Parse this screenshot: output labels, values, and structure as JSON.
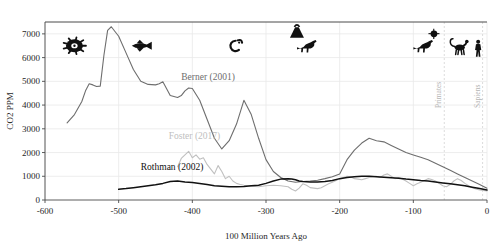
{
  "chart_data": {
    "type": "line",
    "title": "",
    "xlabel": "100 Million Years Ago",
    "ylabel": "CO2 PPM",
    "xlim": [
      -600,
      0
    ],
    "ylim": [
      0,
      7500
    ],
    "grid": true,
    "legend_position": "inline-annotations",
    "xticks": [
      -600,
      -500,
      -400,
      -300,
      -200,
      -100,
      0
    ],
    "xtick_labels": [
      "-600",
      "-500",
      "-400",
      "-300",
      "-200",
      "-100",
      "0"
    ],
    "yticks": [
      0,
      1000,
      2000,
      3000,
      4000,
      5000,
      6000,
      7000
    ],
    "ytick_labels": [
      "0",
      "1000",
      "2000",
      "3000",
      "4000",
      "5000",
      "6000",
      "7000"
    ],
    "series": [
      {
        "name": "Berner (2001)",
        "color": "#6e6e6e",
        "label_x": -415,
        "label_y": 5050,
        "x": [
          -570,
          -560,
          -550,
          -545,
          -540,
          -535,
          -530,
          -525,
          -520,
          -515,
          -510,
          -500,
          -490,
          -480,
          -470,
          -460,
          -450,
          -445,
          -440,
          -430,
          -420,
          -415,
          -410,
          -405,
          -400,
          -390,
          -380,
          -370,
          -360,
          -350,
          -340,
          -330,
          -320,
          -310,
          -300,
          -290,
          -280,
          -270,
          -260,
          -250,
          -240,
          -230,
          -220,
          -210,
          -200,
          -190,
          -180,
          -170,
          -160,
          -150,
          -140,
          -130,
          -120,
          -110,
          -100,
          -90,
          -80,
          -70,
          -60,
          -50,
          -40,
          -30,
          -20,
          -10,
          0
        ],
        "y": [
          3250,
          3600,
          4150,
          4600,
          4900,
          4850,
          4780,
          4800,
          6100,
          7150,
          7300,
          6900,
          6200,
          5500,
          5000,
          4870,
          4850,
          4900,
          4980,
          4400,
          4320,
          4400,
          4600,
          4720,
          4700,
          4200,
          3400,
          2600,
          2150,
          2500,
          3200,
          4200,
          3600,
          2600,
          1700,
          1200,
          950,
          800,
          750,
          780,
          800,
          830,
          900,
          980,
          1100,
          1700,
          2100,
          2400,
          2600,
          2500,
          2450,
          2300,
          2150,
          2000,
          1900,
          1800,
          1700,
          1550,
          1400,
          1250,
          1100,
          950,
          800,
          650,
          500
        ]
      },
      {
        "name": "Foster (2017)",
        "color": "#c0c0c0",
        "label_x": -432,
        "label_y": 2560,
        "x": [
          -420,
          -415,
          -410,
          -405,
          -400,
          -395,
          -390,
          -385,
          -380,
          -375,
          -370,
          -365,
          -360,
          -355,
          -350,
          -345,
          -340,
          -335,
          -330,
          -325,
          -320,
          -310,
          -300,
          -290,
          -280,
          -270,
          -265,
          -260,
          -255,
          -250,
          -245,
          -240,
          -235,
          -230,
          -225,
          -220,
          -215,
          -210,
          -205,
          -200,
          -195,
          -190,
          -185,
          -180,
          -175,
          -170,
          -165,
          -160,
          -155,
          -150,
          -145,
          -140,
          -135,
          -130,
          -125,
          -120,
          -115,
          -110,
          -105,
          -100,
          -95,
          -90,
          -85,
          -80,
          -75,
          -70,
          -65,
          -60,
          -55,
          -50,
          -45,
          -40,
          -35,
          -30,
          -25,
          -20,
          -15,
          -10,
          -5,
          0
        ],
        "y": [
          1400,
          1750,
          1900,
          2050,
          1780,
          1900,
          1720,
          1780,
          1500,
          1300,
          1100,
          1450,
          1200,
          900,
          1000,
          800,
          700,
          650,
          620,
          600,
          580,
          560,
          600,
          620,
          600,
          560,
          450,
          380,
          500,
          680,
          620,
          520,
          500,
          480,
          520,
          600,
          680,
          750,
          820,
          900,
          950,
          1000,
          980,
          900,
          880,
          850,
          900,
          950,
          980,
          1000,
          950,
          1050,
          1100,
          1000,
          900,
          950,
          880,
          800,
          700,
          600,
          680,
          750,
          820,
          900,
          860,
          800,
          700,
          600,
          560,
          650,
          800,
          900,
          820,
          700,
          600,
          520,
          460,
          420,
          400,
          380
        ]
      },
      {
        "name": "Rothman (2002)",
        "color": "#111111",
        "label_x": -470,
        "label_y": 1280,
        "x": [
          -500,
          -490,
          -480,
          -470,
          -460,
          -450,
          -440,
          -430,
          -420,
          -410,
          -400,
          -390,
          -380,
          -370,
          -360,
          -350,
          -340,
          -330,
          -320,
          -310,
          -300,
          -290,
          -280,
          -270,
          -265,
          -260,
          -255,
          -250,
          -240,
          -230,
          -220,
          -210,
          -200,
          -190,
          -180,
          -170,
          -160,
          -150,
          -140,
          -130,
          -120,
          -110,
          -100,
          -90,
          -80,
          -70,
          -60,
          -50,
          -40,
          -30,
          -20,
          -10,
          0
        ],
        "y": [
          450,
          480,
          520,
          560,
          600,
          640,
          700,
          780,
          800,
          760,
          740,
          700,
          650,
          600,
          580,
          560,
          560,
          570,
          600,
          620,
          700,
          800,
          880,
          900,
          880,
          850,
          800,
          780,
          760,
          760,
          780,
          820,
          900,
          950,
          980,
          1000,
          1000,
          980,
          960,
          940,
          920,
          880,
          850,
          820,
          800,
          760,
          720,
          680,
          640,
          600,
          540,
          480,
          420
        ]
      }
    ],
    "event_markers": [
      {
        "name": "primates",
        "label": "Primates",
        "x": -58
      },
      {
        "name": "sapiens",
        "label": "Sapiens",
        "x": -6
      }
    ],
    "era_icons": [
      {
        "name": "trilobite-icon",
        "label": "Trilobite",
        "x": -560,
        "y": 6500
      },
      {
        "name": "fish-icon",
        "label": "Fish",
        "x": -470,
        "y": 6500
      },
      {
        "name": "amphibian-icon",
        "label": "Amphibian",
        "x": -340,
        "y": 6500
      },
      {
        "name": "volcano-icon",
        "label": "Volcano",
        "x": -258,
        "y": 7050
      },
      {
        "name": "dinosaur-icon",
        "label": "Dinosaur",
        "x": -243,
        "y": 6400
      },
      {
        "name": "meteor-icon",
        "label": "Meteor",
        "x": -72,
        "y": 7000
      },
      {
        "name": "dinosaur-late-icon",
        "label": "Dinosaur",
        "x": -85,
        "y": 6400
      },
      {
        "name": "primate-icon",
        "label": "Primate",
        "x": -37,
        "y": 6400
      },
      {
        "name": "human-icon",
        "label": "Human",
        "x": -12,
        "y": 6400
      }
    ]
  }
}
